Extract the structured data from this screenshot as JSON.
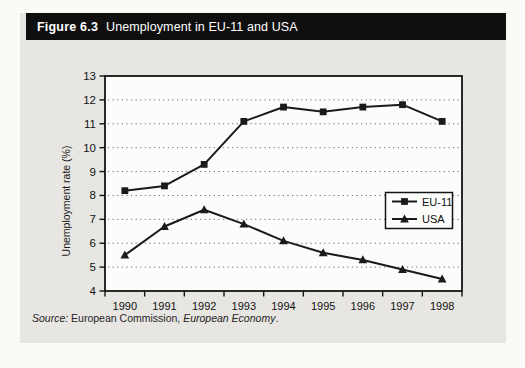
{
  "figure": {
    "label": "Figure 6.3",
    "title": "Unemployment in EU-11 and USA"
  },
  "source": {
    "prefix": "Source:",
    "middle": " European Commission, ",
    "journal": "European Economy",
    "suffix": "."
  },
  "chart_data": {
    "type": "line",
    "title": "Unemployment in EU-11 and USA",
    "categories": [
      "1990",
      "1991",
      "1992",
      "1993",
      "1994",
      "1995",
      "1996",
      "1997",
      "1998"
    ],
    "series": [
      {
        "name": "EU-11",
        "marker": "square",
        "values": [
          8.2,
          8.4,
          9.3,
          11.1,
          11.7,
          11.5,
          11.7,
          11.8,
          11.1
        ]
      },
      {
        "name": "USA",
        "marker": "triangle",
        "values": [
          5.5,
          6.7,
          7.4,
          6.8,
          6.1,
          5.6,
          5.3,
          4.9,
          4.5
        ]
      }
    ],
    "xlabel": "",
    "ylabel": "Unemployment rate (%)",
    "ylim": [
      4,
      13
    ],
    "ytick_step": 1,
    "grid": "horizontal-dotted",
    "legend_position": "middle-right",
    "line_color": "#1a1a1a",
    "plot_background": "#fcfcfa",
    "panel_background": "#e8e6e2",
    "header_background": "#0f0f0f"
  }
}
